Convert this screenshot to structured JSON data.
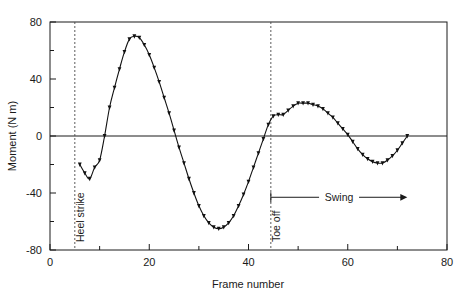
{
  "chart_data": {
    "type": "line",
    "title": "",
    "xlabel": "Frame number",
    "ylabel": "Moment (N m)",
    "xlim": [
      0,
      80
    ],
    "ylim": [
      -80,
      80
    ],
    "xticks": [
      0,
      20,
      40,
      60,
      80
    ],
    "xticklabels": [
      "0",
      "20",
      "40",
      "60",
      "80"
    ],
    "xminorticks": [
      10,
      30,
      50,
      70
    ],
    "yticks": [
      -80,
      -40,
      0,
      40,
      80
    ],
    "yticklabels": [
      "-80",
      "-40",
      "0",
      "40",
      "80"
    ],
    "yminorticks": [
      -60,
      -20,
      20,
      60
    ],
    "grid": false,
    "legend": "none",
    "series": [
      {
        "name": "Knee moment",
        "marker": "filled-triangle",
        "x": [
          6,
          7,
          8,
          9,
          10,
          11,
          12,
          13,
          14,
          15,
          16,
          17,
          18,
          19,
          20,
          21,
          22,
          23,
          24,
          25,
          26,
          27,
          28,
          29,
          30,
          31,
          32,
          33,
          34,
          35,
          36,
          37,
          38,
          39,
          40,
          41,
          42,
          43,
          44,
          45,
          46,
          47,
          48,
          49,
          50,
          51,
          52,
          53,
          54,
          55,
          56,
          57,
          58,
          59,
          60,
          61,
          62,
          63,
          64,
          65,
          66,
          67,
          68,
          69,
          70,
          71,
          72
        ],
        "y": [
          -20,
          -26,
          -30,
          -22,
          -17,
          0,
          20,
          34,
          47,
          59,
          68,
          70,
          69,
          64,
          57,
          48,
          38,
          27,
          16,
          4,
          -8,
          -19,
          -30,
          -40,
          -49,
          -56,
          -61,
          -64,
          -65,
          -64,
          -61,
          -56,
          -49,
          -41,
          -32,
          -22,
          -12,
          -2,
          8,
          14,
          15,
          15,
          18,
          21,
          23,
          23,
          23,
          22,
          21,
          19,
          16,
          13,
          9,
          5,
          1,
          -4,
          -9,
          -13,
          -16,
          -18,
          -19,
          -19,
          -17,
          -14,
          -10,
          -5,
          0
        ]
      }
    ],
    "annotations": [
      {
        "name": "heel-strike",
        "label": "Heel strike",
        "x": 5,
        "orientation": "vertical-line-with-rotated-label"
      },
      {
        "name": "toe-off",
        "label": "Toe off",
        "x": 44.5,
        "orientation": "vertical-line-with-rotated-label"
      },
      {
        "name": "swing-phase",
        "label": "Swing",
        "x_start": 44.5,
        "x_end": 72,
        "y": -43,
        "orientation": "horizontal-arrow"
      }
    ],
    "colors": {
      "curve": "#111111",
      "axis": "#1a1a1a",
      "event_line": "#4a4a4a",
      "background": "#ffffff"
    }
  }
}
